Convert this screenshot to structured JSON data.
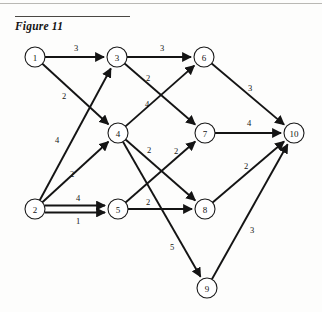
{
  "figure": {
    "title": "Figure 11",
    "caption_rule": true
  },
  "colors": {
    "ink": "#141414",
    "node_fill": "#ffffff",
    "node_stroke": "#1a1a1a",
    "rule_top": "#b9b8b4",
    "rule_figure": "#4a4844",
    "page_background": "#fdfdfc"
  },
  "chart_data": {
    "type": "diagram",
    "title": "Figure 11",
    "subtype": "weighted-directed-graph",
    "node_radius": 10,
    "nodes": [
      {
        "id": "1",
        "label": "1",
        "x": 35,
        "y": 57
      },
      {
        "id": "2",
        "label": "2",
        "x": 35,
        "y": 209
      },
      {
        "id": "3",
        "label": "3",
        "x": 117,
        "y": 57
      },
      {
        "id": "4",
        "label": "4",
        "x": 118,
        "y": 133
      },
      {
        "id": "5",
        "label": "5",
        "x": 118,
        "y": 209
      },
      {
        "id": "6",
        "label": "6",
        "x": 204,
        "y": 57
      },
      {
        "id": "7",
        "label": "7",
        "x": 205,
        "y": 133
      },
      {
        "id": "8",
        "label": "8",
        "x": 205,
        "y": 209
      },
      {
        "id": "9",
        "label": "9",
        "x": 207,
        "y": 288
      },
      {
        "id": "10",
        "label": "10",
        "x": 294,
        "y": 133
      }
    ],
    "edges": [
      {
        "from": "1",
        "to": "3",
        "weight": "3",
        "lx": 76,
        "ly": 48
      },
      {
        "from": "1",
        "to": "4",
        "weight": "2",
        "lx": 64,
        "ly": 96
      },
      {
        "from": "2",
        "to": "3",
        "weight": "4",
        "lx": 57,
        "ly": 140
      },
      {
        "from": "2",
        "to": "4",
        "weight": "2",
        "lx": 72,
        "ly": 174
      },
      {
        "from": "2",
        "to": "5",
        "weight": "4",
        "lx": 78,
        "ly": 198
      },
      {
        "from": "2",
        "to": "5",
        "weight": "1",
        "lx": 78,
        "ly": 221
      },
      {
        "from": "3",
        "to": "6",
        "weight": "3",
        "lx": 162,
        "ly": 48
      },
      {
        "from": "3",
        "to": "7",
        "weight": "2",
        "lx": 148,
        "ly": 78
      },
      {
        "from": "4",
        "to": "6",
        "weight": "4",
        "lx": 147,
        "ly": 104
      },
      {
        "from": "4",
        "to": "8",
        "weight": "2",
        "lx": 149,
        "ly": 150
      },
      {
        "from": "4",
        "to": "9",
        "weight": "5",
        "lx": 172,
        "ly": 247
      },
      {
        "from": "5",
        "to": "7",
        "weight": "2",
        "lx": 176,
        "ly": 151
      },
      {
        "from": "5",
        "to": "8",
        "weight": "2",
        "lx": 148,
        "ly": 202
      },
      {
        "from": "6",
        "to": "10",
        "weight": "3",
        "lx": 250,
        "ly": 88
      },
      {
        "from": "7",
        "to": "10",
        "weight": "4",
        "lx": 249,
        "ly": 123
      },
      {
        "from": "8",
        "to": "10",
        "weight": "2",
        "lx": 246,
        "ly": 166
      },
      {
        "from": "9",
        "to": "10",
        "weight": "3",
        "lx": 252,
        "ly": 230
      }
    ]
  }
}
